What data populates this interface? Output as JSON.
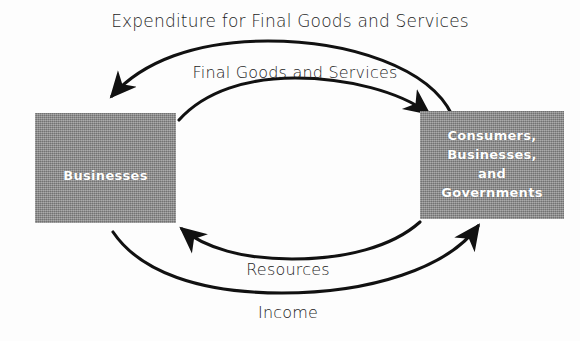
{
  "diagram": {
    "title": "Expenditure for Final Goods and Services",
    "bottom_caption": "Income",
    "nodes": {
      "left": {
        "label": "Businesses",
        "fill_color": "#8c8c8c",
        "text_color": "#ffffff"
      },
      "right": {
        "line1": "Consumers,",
        "line2": "Businesses,",
        "line3": "and",
        "line4": "Governments",
        "fill_color": "#8c8c8c",
        "text_color": "#ffffff"
      }
    },
    "flows": {
      "top_outer": {
        "label": "Expenditure for Final Goods and Services",
        "direction": "right-to-left",
        "from": "Consumers, Businesses, and Governments",
        "to": "Businesses"
      },
      "top_inner": {
        "label": "Final Goods and Services",
        "direction": "left-to-right",
        "from": "Businesses",
        "to": "Consumers, Businesses, and Governments"
      },
      "bottom_inner": {
        "label": "Resources",
        "direction": "right-to-left",
        "from": "Consumers, Businesses, and Governments",
        "to": "Businesses"
      },
      "bottom_outer": {
        "label": "Income",
        "direction": "left-to-right",
        "from": "Businesses",
        "to": "Consumers, Businesses, and Governments"
      }
    },
    "stroke_color": "#111111"
  }
}
